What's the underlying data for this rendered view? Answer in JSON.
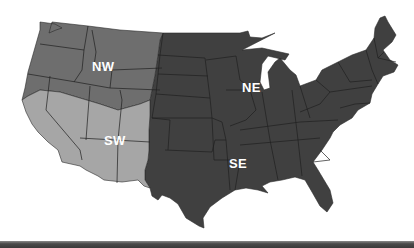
{
  "map": {
    "title": "US regions map",
    "regions": [
      {
        "id": "NW",
        "label": "NW",
        "color": "#6e6e6e",
        "label_pos": [
          92,
          60
        ]
      },
      {
        "id": "NE",
        "label": "NE",
        "color": "#404040",
        "label_pos": [
          242,
          81
        ]
      },
      {
        "id": "SW",
        "label": "SW",
        "color": "#a6a6a6",
        "label_pos": [
          104,
          134
        ]
      },
      {
        "id": "SE",
        "label": "SE",
        "color": "#404040",
        "label_pos": [
          229,
          157
        ]
      }
    ],
    "border_color": "#1a1a1a",
    "background": "#ffffff"
  }
}
